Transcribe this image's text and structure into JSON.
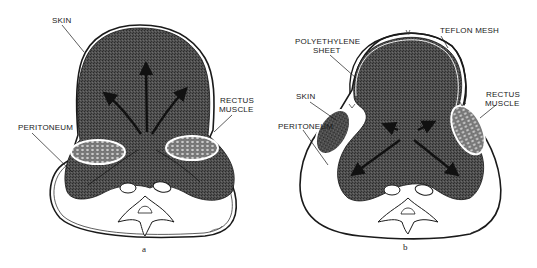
{
  "figure": {
    "panels": [
      {
        "id": "a",
        "caption": "a",
        "labels": {
          "skin": "SKIN",
          "rectus_line1": "RECTUS",
          "rectus_line2": "MUSCLE",
          "peritoneum": "PERITONEUM"
        }
      },
      {
        "id": "b",
        "caption": "b",
        "labels": {
          "teflon": "TEFLON MESH",
          "poly_line1": "POLYETHYLENE",
          "poly_line2": "SHEET",
          "skin": "SKIN",
          "rectus_line1": "RECTUS",
          "rectus_line2": "MUSCLE",
          "peritoneum": "PERITONEUM"
        }
      }
    ],
    "colors": {
      "viscera_fill": "#4a4a4a",
      "line": "#1a1a1a",
      "background": "#ffffff"
    }
  }
}
